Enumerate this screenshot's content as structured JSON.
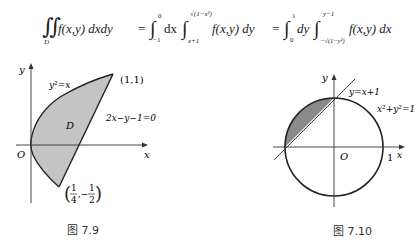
{
  "formula": {
    "lhs_integral": "∬",
    "lhs_domain": "D",
    "lhs_integrand": "f(x,y) dxdy",
    "eq1": "=",
    "mid_outer_sign": "∫",
    "mid_outer_lower": "−1",
    "mid_outer_upper": "0",
    "mid_outer_diff": "dx",
    "mid_inner_sign": "∫",
    "mid_inner_lower": "x+1",
    "mid_inner_upper": "√(1−x²)",
    "mid_integrand": "f(x,y) dy",
    "eq2": "=",
    "rhs_outer_sign": "∫",
    "rhs_outer_lower": "0",
    "rhs_outer_upper": "1",
    "rhs_outer_diff": "dy",
    "rhs_inner_sign": "∫",
    "rhs_inner_lower": "−√(1−y²)",
    "rhs_inner_upper": "y−1",
    "rhs_integrand": "f(x,y) dx"
  },
  "figure_7_9": {
    "caption": "图 7.9",
    "axis_x_label": "x",
    "axis_y_label": "y",
    "origin_label": "O",
    "region_label": "D",
    "curve_label": "y²=x",
    "line_label": "2x−y−1=0",
    "point_top": "(1,1)",
    "point_bottom_num_x": "1",
    "point_bottom_den_x": "4",
    "point_bottom_sep": ",−",
    "point_bottom_num_y": "1",
    "point_bottom_den_y": "2",
    "region_fill": "#c4c4c4"
  },
  "figure_7_10": {
    "caption": "图 7.10",
    "axis_x_label": "x",
    "axis_y_label": "y",
    "origin_label": "O",
    "tick_label": "1",
    "line_label": "y=x+1",
    "circle_label": "x²+y²=1",
    "region_fill": "#8a8a8a"
  }
}
